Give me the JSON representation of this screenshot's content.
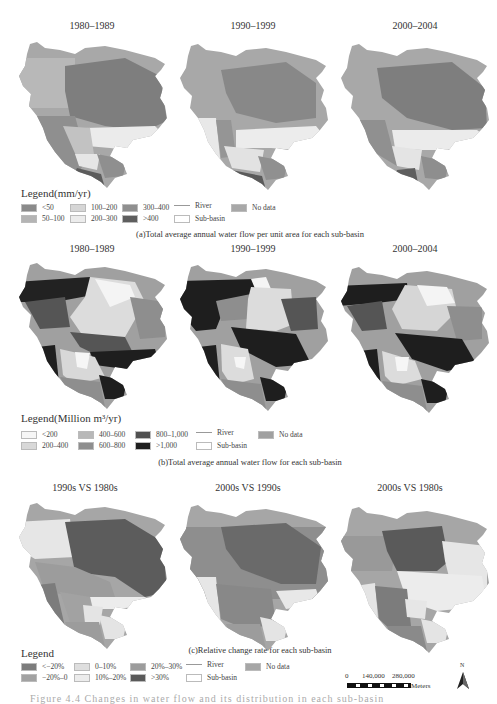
{
  "panels": [
    {
      "id": "a",
      "map_titles": [
        "1980–1989",
        "1990–1999",
        "2000–2004"
      ],
      "legend_title": "Legend(mm/yr)",
      "legend": [
        {
          "label": "<50",
          "color": "#8a8a8a"
        },
        {
          "label": "50–100",
          "color": "#b4b4b4"
        },
        {
          "label": "100–200",
          "color": "#d6d6d6"
        },
        {
          "label": "200–300",
          "color": "#ececec"
        },
        {
          "label": "300–400",
          "color": "#8f8f8f"
        },
        {
          "label": ">400",
          "color": "#5e5e5e"
        },
        {
          "label": "River",
          "type": "line"
        },
        {
          "label": "Sub-basin",
          "type": "outline"
        },
        {
          "label": "No data",
          "color": "#a8a8a8"
        }
      ],
      "caption": "(a)Total average annual water flow per unit area for each sub-basin"
    },
    {
      "id": "b",
      "map_titles": [
        "1980–1989",
        "1990–1999",
        "2000–2004"
      ],
      "legend_title": "Legend(Million m³/yr)",
      "legend": [
        {
          "label": "<200",
          "color": "#f6f6f6"
        },
        {
          "label": "200–400",
          "color": "#d8d8d8"
        },
        {
          "label": "400–600",
          "color": "#b8b8b8"
        },
        {
          "label": "600–800",
          "color": "#8e8e8e"
        },
        {
          "label": "800–1,000",
          "color": "#505050"
        },
        {
          "label": ">1,000",
          "color": "#1e1e1e"
        },
        {
          "label": "River",
          "type": "line"
        },
        {
          "label": "Sub-basin",
          "type": "outline"
        },
        {
          "label": "No data",
          "color": "#a0a0a0"
        }
      ],
      "caption": "(b)Total average annual water flow for each sub-basin"
    },
    {
      "id": "c",
      "map_titles": [
        "1990s VS 1980s",
        "2000s VS 1990s",
        "2000s VS 1980s"
      ],
      "legend_title": "Legend",
      "legend": [
        {
          "label": "<−20%",
          "color": "#7c7c7c"
        },
        {
          "label": "−20%–0",
          "color": "#a2a2a2"
        },
        {
          "label": "0–10%",
          "color": "#dedede"
        },
        {
          "label": "10%–20%",
          "color": "#ececec"
        },
        {
          "label": "20%–30%",
          "color": "#9c9c9c"
        },
        {
          "label": ">30%",
          "color": "#5a5a5a"
        },
        {
          "label": "River",
          "type": "line"
        },
        {
          "label": "Sub-basin",
          "type": "outline"
        },
        {
          "label": "No data",
          "color": "#a6a6a6"
        }
      ],
      "caption": "(c)Relative change rate for each sub-basin"
    }
  ],
  "scale": {
    "ticks": [
      "0",
      "140,000",
      "280,000"
    ],
    "unit": "Meters"
  },
  "north_label": "N",
  "figure_caption_faded": "Figure 4.4  Changes in water flow and its distribution in each sub-basin"
}
